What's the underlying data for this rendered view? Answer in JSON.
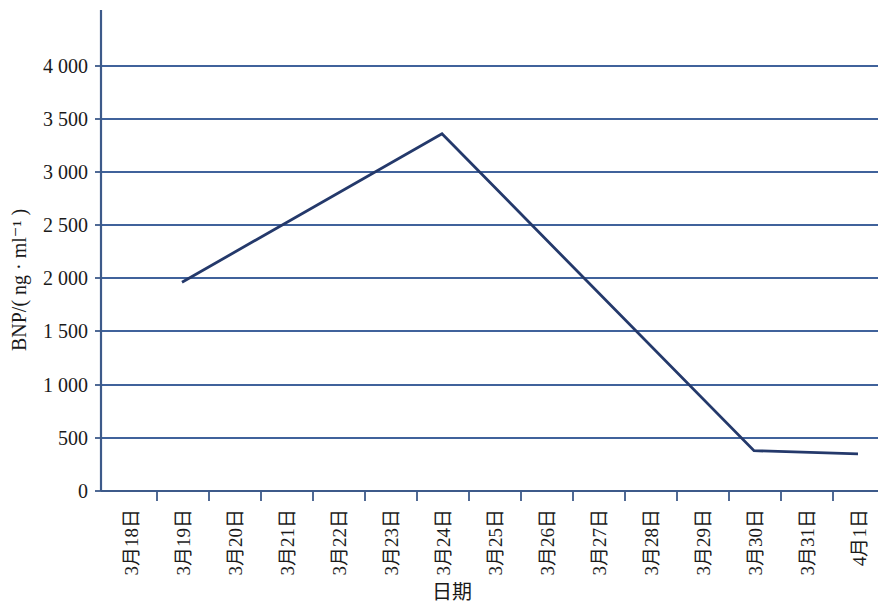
{
  "chart_data": {
    "type": "line",
    "title": "",
    "subtitle": "",
    "xlabel": "日期",
    "ylabel": "BNP/( ng · ml⁻¹ )",
    "ylim": [
      0,
      4300
    ],
    "ytick_values": [
      0,
      500,
      1000,
      1500,
      2000,
      2500,
      3000,
      3500,
      4000
    ],
    "ytick_labels": [
      "0",
      "500",
      "1 000",
      "1 500",
      "2 000",
      "2 500",
      "3 000",
      "3 500",
      "4 000"
    ],
    "grid": true,
    "grid_axis": "y",
    "legend": false,
    "legend_position": "none",
    "categories": [
      "3月18日",
      "3月19日",
      "3月20日",
      "3月21日",
      "3月22日",
      "3月23日",
      "3月24日",
      "3月25日",
      "3月26日",
      "3月27日",
      "3月28日",
      "3月29日",
      "3月30日",
      "3月31日",
      "4月1日"
    ],
    "series": [
      {
        "name": "BNP",
        "color": "#24396b",
        "points": [
          {
            "x": "3月19日",
            "y": 1970
          },
          {
            "x": "3月24日",
            "y": 3370
          },
          {
            "x": "3月30日",
            "y": 380
          },
          {
            "x": "4月1日",
            "y": 350
          }
        ],
        "values": [
          null,
          1970,
          2250,
          2530,
          2810,
          3090,
          3370,
          2872,
          2373,
          1875,
          1377,
          878,
          380,
          365,
          350
        ]
      }
    ]
  }
}
